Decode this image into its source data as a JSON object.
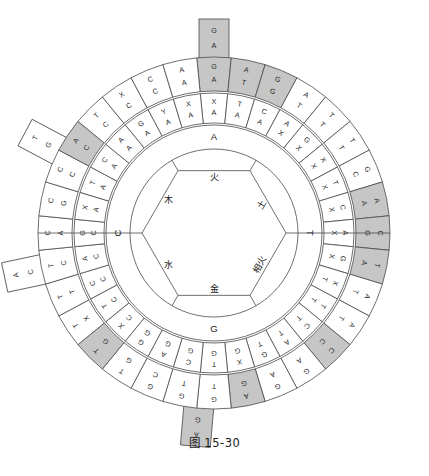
{
  "figure": {
    "caption": "图 15-30",
    "type": "radial-concentric-wheel-diagram",
    "canvas": {
      "width": 429,
      "height": 476
    },
    "center": {
      "x": 214,
      "y": 233
    },
    "colors": {
      "background": "#ffffff",
      "stroke": "#4a4a4a",
      "cell_plain": "#ffffff",
      "cell_highlight": "#c6c6c6",
      "text": "#2b2b2b"
    }
  },
  "rings": {
    "inner_hexagon": {
      "name": "five-elements-hexagon",
      "radius": 72,
      "labels": [
        {
          "text": "火",
          "position": "top"
        },
        {
          "text": "土",
          "position": "upper-right"
        },
        {
          "text": "相火",
          "position": "lower-right"
        },
        {
          "text": "金",
          "position": "bottom"
        },
        {
          "text": "水",
          "position": "lower-left"
        },
        {
          "text": "木",
          "position": "upper-left"
        }
      ]
    },
    "inner_label_ring": {
      "name": "base-label-ring",
      "radius_inner": 84,
      "radius_outer": 108,
      "labels": [
        {
          "text": "A",
          "position": "top"
        },
        {
          "text": "T",
          "position": "right"
        },
        {
          "text": "G",
          "position": "bottom"
        },
        {
          "text": "C",
          "position": "left"
        }
      ]
    },
    "middle_ring": {
      "name": "middle-codon-ring",
      "radius_inner": 110,
      "radius_outer": 140,
      "segment_count": 32,
      "cells": [
        {
          "index": 0,
          "text": "XA",
          "highlight": false
        },
        {
          "index": 1,
          "text": "TA",
          "highlight": false
        },
        {
          "index": 2,
          "text": "CA",
          "highlight": false
        },
        {
          "index": 3,
          "text": "AX",
          "highlight": false
        },
        {
          "index": 4,
          "text": "GX",
          "highlight": false
        },
        {
          "index": 5,
          "text": "XX",
          "highlight": false
        },
        {
          "index": 6,
          "text": "TX",
          "highlight": false
        },
        {
          "index": 7,
          "text": "CX",
          "highlight": false
        },
        {
          "index": 8,
          "text": "AX",
          "highlight": false
        },
        {
          "index": 9,
          "text": "GX",
          "highlight": false
        },
        {
          "index": 10,
          "text": "XT",
          "highlight": false
        },
        {
          "index": 11,
          "text": "TT",
          "highlight": false
        },
        {
          "index": 12,
          "text": "CT",
          "highlight": false
        },
        {
          "index": 13,
          "text": "AT",
          "highlight": false
        },
        {
          "index": 14,
          "text": "GT",
          "highlight": false
        },
        {
          "index": 15,
          "text": "XG",
          "highlight": false
        },
        {
          "index": 16,
          "text": "TG",
          "highlight": false
        },
        {
          "index": 17,
          "text": "CG",
          "highlight": false
        },
        {
          "index": 18,
          "text": "AG",
          "highlight": false
        },
        {
          "index": 19,
          "text": "GG",
          "highlight": false
        },
        {
          "index": 20,
          "text": "XC",
          "highlight": false
        },
        {
          "index": 21,
          "text": "TC",
          "highlight": false
        },
        {
          "index": 22,
          "text": "CC",
          "highlight": false
        },
        {
          "index": 23,
          "text": "AC",
          "highlight": false
        },
        {
          "index": 24,
          "text": "GC",
          "highlight": false
        },
        {
          "index": 25,
          "text": "XA",
          "highlight": false
        },
        {
          "index": 26,
          "text": "TA",
          "highlight": false
        },
        {
          "index": 27,
          "text": "CA",
          "highlight": false
        },
        {
          "index": 28,
          "text": "AA",
          "highlight": false
        },
        {
          "index": 29,
          "text": "GA",
          "highlight": false
        },
        {
          "index": 30,
          "text": "YA",
          "highlight": false
        },
        {
          "index": 31,
          "text": "XA",
          "highlight": false
        }
      ]
    },
    "outer_ring": {
      "name": "outer-codon-ring",
      "radius_inner": 142,
      "radius_outer": 176,
      "segment_count": 32,
      "cells": [
        {
          "index": 0,
          "text": "GA",
          "highlight": true
        },
        {
          "index": 1,
          "text": "AT",
          "highlight": true
        },
        {
          "index": 2,
          "text": "GG",
          "highlight": true
        },
        {
          "index": 3,
          "text": "AT",
          "highlight": false
        },
        {
          "index": 4,
          "text": "TT",
          "highlight": false
        },
        {
          "index": 5,
          "text": "TT",
          "highlight": false
        },
        {
          "index": 6,
          "text": "GC",
          "highlight": false
        },
        {
          "index": 7,
          "text": "AA",
          "highlight": true
        },
        {
          "index": 8,
          "text": "CG",
          "highlight": true
        },
        {
          "index": 9,
          "text": "TA",
          "highlight": true
        },
        {
          "index": 10,
          "text": "AT",
          "highlight": false
        },
        {
          "index": 11,
          "text": "AT",
          "highlight": false
        },
        {
          "index": 12,
          "text": "CC",
          "highlight": true
        },
        {
          "index": 13,
          "text": "GA",
          "highlight": false
        },
        {
          "index": 14,
          "text": "GA",
          "highlight": false
        },
        {
          "index": 15,
          "text": "AG",
          "highlight": true
        },
        {
          "index": 16,
          "text": "GT",
          "highlight": false
        },
        {
          "index": 17,
          "text": "GT",
          "highlight": false
        },
        {
          "index": 18,
          "text": "GC",
          "highlight": false
        },
        {
          "index": 19,
          "text": "TG",
          "highlight": false
        },
        {
          "index": 20,
          "text": "TG",
          "highlight": true
        },
        {
          "index": 21,
          "text": "TX",
          "highlight": false
        },
        {
          "index": 22,
          "text": "TT",
          "highlight": false
        },
        {
          "index": 23,
          "text": "TC",
          "highlight": false
        },
        {
          "index": 24,
          "text": "CA",
          "highlight": false
        },
        {
          "index": 25,
          "text": "CG",
          "highlight": false
        },
        {
          "index": 26,
          "text": "CC",
          "highlight": false
        },
        {
          "index": 27,
          "text": "AC",
          "highlight": true
        },
        {
          "index": 28,
          "text": "TC",
          "highlight": false
        },
        {
          "index": 29,
          "text": "XC",
          "highlight": false
        },
        {
          "index": 30,
          "text": "CC",
          "highlight": false
        },
        {
          "index": 31,
          "text": "AA",
          "highlight": false
        }
      ]
    }
  },
  "tabs": [
    {
      "name": "tab-top",
      "text": "GA",
      "highlight": true,
      "angle_deg": -90
    },
    {
      "name": "tab-left",
      "text": "AC",
      "highlight": false,
      "angle_deg": 168
    },
    {
      "name": "tab-lower-left",
      "text": "TG",
      "highlight": false,
      "angle_deg": 208
    },
    {
      "name": "tab-bottom",
      "text": "AG",
      "highlight": true,
      "angle_deg": 95
    }
  ]
}
